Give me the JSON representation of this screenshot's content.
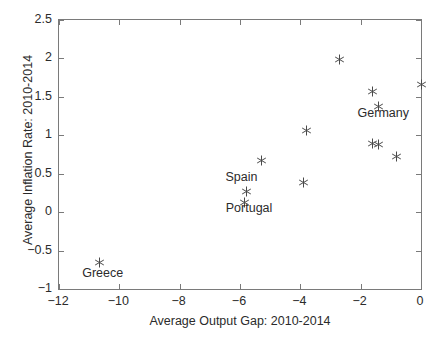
{
  "chart_data": {
    "type": "scatter",
    "title": "",
    "xlabel": "Average Output Gap: 2010-2014",
    "ylabel": "Average Inflation Rate: 2010-2014",
    "xlim": [
      -12,
      0
    ],
    "ylim": [
      -1,
      2.5
    ],
    "xticks": [
      -12,
      -10,
      -8,
      -6,
      -4,
      -2,
      0
    ],
    "xtick_labels": [
      "−12",
      "−10",
      "−8",
      "−6",
      "−4",
      "−2",
      "0"
    ],
    "yticks": [
      -1,
      -0.5,
      0,
      0.5,
      1,
      1.5,
      2,
      2.5
    ],
    "ytick_labels": [
      "−1",
      "−0.5",
      "0",
      "0.5",
      "1",
      "1.5",
      "2",
      "2.5"
    ],
    "grid": false,
    "legend": null,
    "marker_style": "asterisk",
    "marker_color": "#4a4a4a",
    "points": [
      {
        "x": -10.65,
        "y": -0.66,
        "label": "Greece"
      },
      {
        "x": -5.85,
        "y": 0.12,
        "label": "Portugal"
      },
      {
        "x": -5.8,
        "y": 0.27,
        "label": "Spain"
      },
      {
        "x": -5.3,
        "y": 0.67,
        "label": ""
      },
      {
        "x": -3.9,
        "y": 0.39,
        "label": ""
      },
      {
        "x": -3.8,
        "y": 1.06,
        "label": ""
      },
      {
        "x": -2.7,
        "y": 1.99,
        "label": ""
      },
      {
        "x": -1.62,
        "y": 1.57,
        "label": ""
      },
      {
        "x": -1.42,
        "y": 1.37,
        "label": "Germany"
      },
      {
        "x": -1.6,
        "y": 0.89,
        "label": ""
      },
      {
        "x": -1.42,
        "y": 0.88,
        "label": ""
      },
      {
        "x": -0.8,
        "y": 0.72,
        "label": ""
      },
      {
        "x": 0.0,
        "y": 1.66,
        "label": ""
      }
    ],
    "annotations": [
      {
        "text": "Greece",
        "x": -10.55,
        "y": -0.8
      },
      {
        "text": "Spain",
        "x": -5.95,
        "y": 0.45
      },
      {
        "text": "Portugal",
        "x": -5.7,
        "y": 0.04
      },
      {
        "text": "Germany",
        "x": -1.25,
        "y": 1.28
      }
    ]
  }
}
